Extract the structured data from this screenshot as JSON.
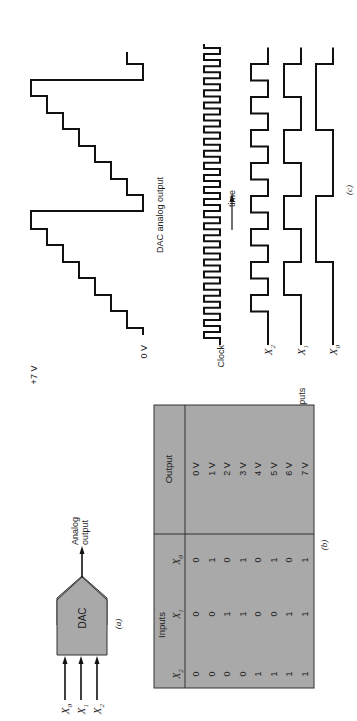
{
  "figure": {
    "orientation": "rotated-90-ccw",
    "background": "#ffffff",
    "panel_fill": "#a9a9a9",
    "line_color": "#111111"
  },
  "panel_a": {
    "caption": "(a)",
    "block_label": "DAC",
    "inputs": [
      "X0",
      "X1",
      "X2"
    ],
    "input_labels": [
      {
        "base": "X",
        "sub": "0"
      },
      {
        "base": "X",
        "sub": "1"
      },
      {
        "base": "X",
        "sub": "2"
      }
    ],
    "output_label_line1": "Analog",
    "output_label_line2": "output"
  },
  "panel_b": {
    "caption": "(b)",
    "group_header_inputs": "Inputs",
    "group_header_output": "Output",
    "columns": [
      {
        "base": "X",
        "sub": "2"
      },
      {
        "base": "X",
        "sub": "1"
      },
      {
        "base": "X",
        "sub": "0"
      }
    ],
    "rows": [
      {
        "x2": "0",
        "x1": "0",
        "x0": "0",
        "out": "0 V"
      },
      {
        "x2": "0",
        "x1": "0",
        "x0": "1",
        "out": "1 V"
      },
      {
        "x2": "0",
        "x1": "1",
        "x0": "0",
        "out": "2 V"
      },
      {
        "x2": "0",
        "x1": "1",
        "x0": "1",
        "out": "3 V"
      },
      {
        "x2": "1",
        "x1": "0",
        "x0": "0",
        "out": "4 V"
      },
      {
        "x2": "1",
        "x1": "0",
        "x0": "1",
        "out": "5 V"
      },
      {
        "x2": "1",
        "x1": "1",
        "x0": "0",
        "out": "6 V"
      },
      {
        "x2": "1",
        "x1": "1",
        "x0": "1",
        "out": "7 V"
      }
    ]
  },
  "panel_c": {
    "caption": "(c)",
    "top_voltage_label": "+7 V",
    "bottom_voltage_label": "0 V",
    "output_title": "DAC analog output",
    "clock_label": "Clock",
    "time_label": "time",
    "inputs_label": "Inputs",
    "signal_labels": [
      {
        "base": "X",
        "sub": "2"
      },
      {
        "base": "X",
        "sub": "1"
      },
      {
        "base": "X",
        "sub": "0"
      }
    ],
    "clock_pulses": 24
  },
  "chart_data": {
    "type": "line",
    "title": "DAC analog output",
    "xlabel": "time",
    "ylabel": "Voltage",
    "ylim": [
      0,
      7
    ],
    "y_ticks": [
      "0 V",
      "+7 V"
    ],
    "series": [
      {
        "name": "DAC analog output",
        "values": [
          0,
          1,
          2,
          3,
          4,
          5,
          6,
          7,
          0,
          1,
          2,
          3,
          4,
          5,
          6,
          7,
          0,
          1
        ]
      },
      {
        "name": "X2",
        "values": [
          0,
          1,
          0,
          1,
          0,
          1,
          0,
          1,
          0,
          1,
          0,
          1,
          0,
          1,
          0,
          1,
          0,
          1
        ]
      },
      {
        "name": "X1",
        "values": [
          0,
          0,
          1,
          1,
          0,
          0,
          1,
          1,
          0,
          0,
          1,
          1,
          0,
          0,
          1,
          1,
          0,
          0
        ]
      },
      {
        "name": "X0",
        "values": [
          0,
          0,
          0,
          0,
          1,
          1,
          1,
          1,
          0,
          0,
          0,
          0,
          1,
          1,
          1,
          1,
          0,
          0
        ]
      }
    ],
    "grid": false
  }
}
